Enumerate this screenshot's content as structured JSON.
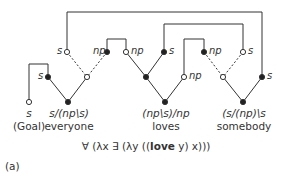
{
  "diagram": {
    "type": "proof-net",
    "words": [
      {
        "category": "s",
        "word": "(Goal)"
      },
      {
        "category": "s/(np\\s)",
        "word": "everyone"
      },
      {
        "category": "(np\\s)/np",
        "word": "loves"
      },
      {
        "category": "(s/(np)\\s",
        "word": "somebody"
      }
    ],
    "node_labels": {
      "n1": "s",
      "n2": "np",
      "n3": "np",
      "n4": "s",
      "n5": "np",
      "n6": "s",
      "n7": "s",
      "n8": "np",
      "n9": "s"
    },
    "formula": {
      "prefix": "∀ (λx ∃ (λy ((",
      "bold": "love",
      "suffix": " y) x)))"
    },
    "panel_label": "(a)"
  }
}
